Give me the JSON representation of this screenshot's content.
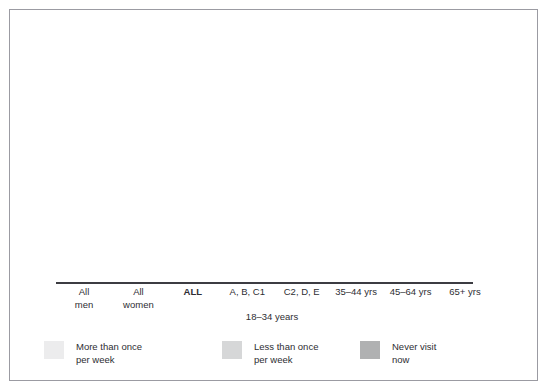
{
  "chart_data": {
    "type": "bar",
    "subtype": "stacked-bar-100-percent",
    "title": "",
    "xlabel": "",
    "ylabel": "",
    "ylim": [
      0,
      100
    ],
    "grid": false,
    "legend_position": "bottom-left",
    "categories": [
      "All men",
      "All women",
      "ALL",
      "A, B, C1",
      "C2, D, E",
      "35–44 yrs",
      "45–64 yrs",
      "65+ yrs"
    ],
    "category_lines": [
      [
        "All",
        "men"
      ],
      [
        "All",
        "women"
      ],
      [
        "ALL",
        ""
      ],
      [
        "A, B, C1",
        ""
      ],
      [
        "C2, D, E",
        ""
      ],
      [
        "35–44 yrs",
        ""
      ],
      [
        "45–64 yrs",
        ""
      ],
      [
        "65+ yrs",
        ""
      ]
    ],
    "group_label": "18–34 years",
    "group_label_members": [
      "A, B, C1",
      "C2, D, E"
    ],
    "emphasized_category": "ALL",
    "series": [
      {
        "name": "More than once per week",
        "color": "#ececed",
        "values": [
          50,
          28,
          40,
          58,
          52,
          43,
          33,
          40
        ]
      },
      {
        "name": "Less than once per week",
        "color": "#d6d7d8",
        "values": [
          30,
          36,
          34,
          37,
          37,
          42,
          32,
          7
        ]
      },
      {
        "name": "Never visit now",
        "color": "#b0b1b2",
        "values": [
          20,
          36,
          26,
          5,
          11,
          15,
          35,
          53
        ]
      }
    ]
  },
  "legend": {
    "items": [
      {
        "label_line1": "More than once",
        "label_line2": "per week",
        "color": "#ececed"
      },
      {
        "label_line1": "Less than once",
        "label_line2": "per week",
        "color": "#d6d7d8"
      },
      {
        "label_line1": "Never visit",
        "label_line2": "now",
        "color": "#b0b1b2"
      }
    ]
  },
  "colors": {
    "frame_border": "#9b9ba2",
    "axis_line": "#3c3c42",
    "text": "#2e2e33",
    "background": "#ffffff"
  }
}
